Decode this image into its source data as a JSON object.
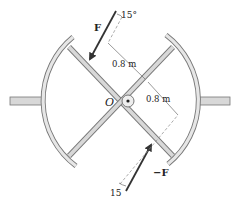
{
  "diagram": {
    "center_label": "O",
    "force_top": {
      "label": "F",
      "angle_label": "15°"
    },
    "force_bottom": {
      "label": "−F",
      "angle_label": "15"
    },
    "dimension_1": "0.8 m",
    "dimension_2": "0.8 m",
    "caption": ""
  },
  "colors": {
    "stroke": "#666666",
    "fill": "#d8d8d8",
    "arrow": "#333333",
    "text": "#222222"
  }
}
